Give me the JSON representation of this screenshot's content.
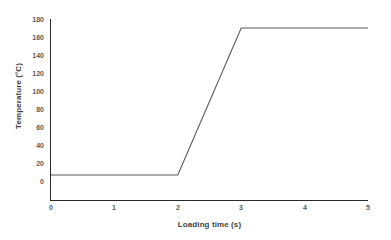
{
  "chart_data": {
    "type": "line",
    "title": "",
    "xlabel": "Loading time (s)",
    "ylabel": "Temperature (°C)",
    "xlim": [
      0,
      5
    ],
    "ylim": [
      0,
      180
    ],
    "xticks": [
      "0",
      "1",
      "2",
      "3",
      "4",
      "5"
    ],
    "yticks": [
      "0",
      "20",
      "40",
      "60",
      "80",
      "100",
      "120",
      "140",
      "160",
      "180"
    ],
    "grid": false,
    "legend": "none",
    "series": [
      {
        "name": "Temperature profile",
        "color": "#595959",
        "x": [
          0,
          2,
          3,
          5
        ],
        "values": [
          25,
          25,
          172,
          172
        ]
      }
    ],
    "annotations": []
  },
  "axes": {
    "y_title": "Temperature (°C)",
    "x_title": "Loading time (s)",
    "y_tick_labels": [
      "180",
      "160",
      "140",
      "120",
      "100",
      "80",
      "60",
      "40",
      "20",
      "0"
    ],
    "x_tick_labels": [
      "0",
      "1",
      "2",
      "3",
      "4",
      "5"
    ],
    "axis_color": "#2b2b2b",
    "label_color": "#5a5a5a",
    "title_color": "#3f3f3f"
  }
}
